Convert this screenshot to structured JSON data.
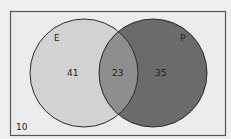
{
  "diagram": {
    "type": "venn",
    "universe": {
      "outside_value": "10",
      "background_color": "#ececec",
      "border_color": "#555555"
    },
    "sets": [
      {
        "name": "E",
        "only_value": "41",
        "fill_color": "#d2d2d2"
      },
      {
        "name": "P",
        "only_value": "35",
        "fill_color": "#6b6b6b"
      }
    ],
    "intersection": {
      "value": "23",
      "fill_color": "#8e8e8e"
    },
    "outline_color": "#2a2a2a"
  }
}
